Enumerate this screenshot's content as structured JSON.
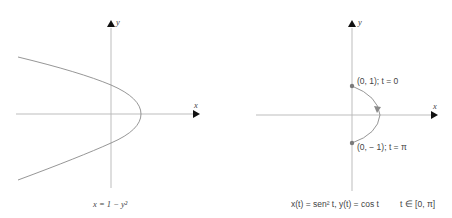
{
  "left_panel": {
    "axis_x_label": "x",
    "axis_y_label": "y",
    "caption": "x = 1 − y²",
    "equation": "x = 1 - y^2"
  },
  "right_panel": {
    "axis_x_label": "x",
    "axis_y_label": "y",
    "point_start_label": "(0, 1); t = 0",
    "point_end_label": "(0, − 1); t = π",
    "caption_eq": "x(t) = sen² t, y(t) = cos t",
    "caption_domain": "t ∈ [0, π]"
  },
  "colors": {
    "axis": "#b5b5b5",
    "curve": "#8a8a8a",
    "point": "#7a7a7a",
    "arrow": "#111111",
    "text": "#444444"
  }
}
